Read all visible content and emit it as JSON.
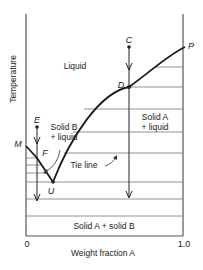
{
  "axes": {
    "x_label": "Weight fraction A",
    "y_label": "Temperature",
    "x_ticks": [
      "0",
      "1.0"
    ]
  },
  "regions": {
    "liquid": "Liquid",
    "solid_b_liquid_line1": "Solid B",
    "solid_b_liquid_line2": "+ liquid",
    "solid_a_liquid_line1": "Solid A",
    "solid_a_liquid_line2": "+ liquid",
    "solid_a_solid_b": "Solid A + solid B"
  },
  "points": {
    "C": "C",
    "D": "D",
    "E": "E",
    "F": "F",
    "M": "M",
    "P": "P",
    "U": "U"
  },
  "annotations": {
    "tie_line": "Tie line"
  },
  "colors": {
    "line": "#1a1a1a",
    "axis": "#333333",
    "text": "#222222"
  }
}
